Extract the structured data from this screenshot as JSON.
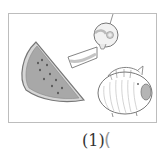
{
  "figure": {
    "items": [
      {
        "name": "watermelon-slice"
      },
      {
        "name": "wind-chime"
      },
      {
        "name": "pig-mosquito-coil-holder"
      }
    ]
  },
  "caption": {
    "number_label": "(1)",
    "answer_open": "("
  },
  "colors": {
    "frame_border": "#bdbdbd",
    "outline": "#7a7a7a",
    "fill_flesh": "#a9a9a9",
    "fill_light": "#e6e6e6",
    "text": "#333333"
  }
}
